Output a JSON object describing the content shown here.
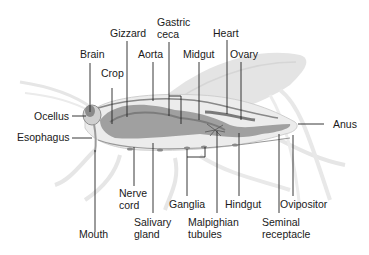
{
  "diagram": {
    "labels": {
      "gizzard": "Gizzard",
      "gastric_ceca_1": "Gastric",
      "gastric_ceca_2": "ceca",
      "heart": "Heart",
      "brain": "Brain",
      "aorta": "Aorta",
      "midgut": "Midgut",
      "ovary": "Ovary",
      "crop": "Crop",
      "ocellus": "Ocellus",
      "anus": "Anus",
      "esophagus": "Esophagus",
      "nerve_cord_1": "Nerve",
      "nerve_cord_2": "cord",
      "ganglia": "Ganglia",
      "hindgut": "Hindgut",
      "ovipositor": "Ovipositor",
      "mouth": "Mouth",
      "salivary_gland_1": "Salivary",
      "salivary_gland_2": "gland",
      "malpighian_tubules_1": "Malpighian",
      "malpighian_tubules_2": "tubules",
      "seminal_receptacle_1": "Seminal",
      "seminal_receptacle_2": "receptacle"
    },
    "colors": {
      "body_outline": "#e2e2e2",
      "organ_dark": "#8a8a8a",
      "organ_mid": "#a9a9a9",
      "leader_line": "#222222",
      "text": "#1a1a1a"
    }
  }
}
